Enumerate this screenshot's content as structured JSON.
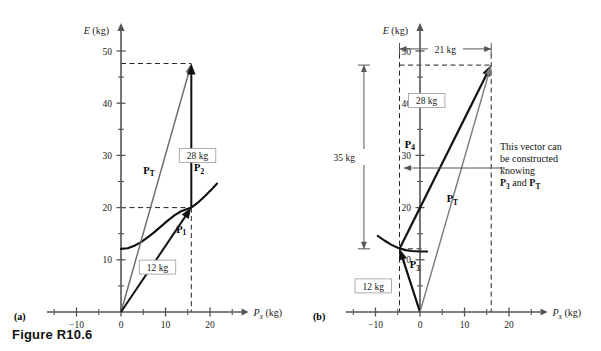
{
  "figure": {
    "caption": "Figure R10.6",
    "panel_a_letter": "(a)",
    "panel_b_letter": "(b)"
  },
  "axes": {
    "y_title_symbol": "E",
    "y_title_unit": " (kg)",
    "x_title_symbol": "P",
    "x_title_sub": "x",
    "x_title_unit": " (kg)",
    "x_ticks": [
      -10,
      0,
      10,
      20
    ],
    "x_tick_labels": [
      "−10",
      "0",
      "10",
      "20"
    ],
    "x_minor_ticks": [
      -15,
      -5,
      5,
      15,
      25
    ],
    "y_ticks": [
      10,
      20,
      30,
      40,
      50
    ],
    "y_tick_labels": [
      "10",
      "20",
      "30",
      "40",
      "50"
    ],
    "y_minor_ticks": [
      5,
      15,
      25,
      35,
      45
    ],
    "x_range": [
      -18,
      28
    ],
    "y_range": [
      0,
      55
    ]
  },
  "panel_a": {
    "vectors": [
      {
        "name": "P_T",
        "label_symbol": "P",
        "label_sub": "T",
        "label_x": 5.0,
        "label_y": 26.5,
        "from": [
          0,
          0
        ],
        "to": [
          15.8,
          47.6
        ],
        "color": "#6f6f6f",
        "width": 1.5,
        "head": "open"
      },
      {
        "name": "P_1",
        "label_symbol": "P",
        "label_sub": "1",
        "label_x": 12.4,
        "label_y": 15.2,
        "from": [
          0,
          0
        ],
        "to": [
          15.8,
          20.0
        ],
        "color": "#111111",
        "width": 2.0,
        "head": "solid"
      },
      {
        "name": "P_2",
        "label_symbol": "P",
        "label_sub": "2",
        "label_x": 16.4,
        "label_y": 27.0,
        "from": [
          15.8,
          20.0
        ],
        "to": [
          15.8,
          47.6
        ],
        "color": "#111111",
        "width": 2.0,
        "head": "solid"
      }
    ],
    "curve_points": [
      [
        0,
        12.1
      ],
      [
        1.5,
        12.2
      ],
      [
        3,
        12.7
      ],
      [
        4.5,
        13.4
      ],
      [
        6,
        14.3
      ],
      [
        7.5,
        15.3
      ],
      [
        9,
        16.4
      ],
      [
        10.5,
        17.5
      ],
      [
        12,
        18.5
      ],
      [
        13.5,
        19.3
      ],
      [
        15.8,
        20.0
      ],
      [
        17.5,
        21.1
      ],
      [
        19,
        22.3
      ],
      [
        20.5,
        23.6
      ],
      [
        21.6,
        24.6
      ]
    ],
    "box_labels": [
      {
        "name": "label-28kg",
        "text": "28 kg",
        "x": 17.2,
        "y": 30.0
      },
      {
        "name": "label-12kg",
        "text": "12 kg",
        "x": 8.2,
        "y": 8.6
      }
    ],
    "dashed_guides": [
      {
        "name": "guide-horizontal-47",
        "from": [
          0,
          47.6
        ],
        "to": [
          15.8,
          47.6
        ]
      },
      {
        "name": "guide-horizontal-20",
        "from": [
          0,
          20.0
        ],
        "to": [
          15.8,
          20.0
        ]
      },
      {
        "name": "guide-vertical-15.8",
        "from": [
          15.8,
          20.0
        ],
        "to": [
          15.8,
          0
        ]
      }
    ]
  },
  "panel_b": {
    "vectors": [
      {
        "name": "P_3",
        "label_symbol": "P",
        "label_sub": "3",
        "label_x": -2.3,
        "label_y": 8.4,
        "from": [
          0,
          0
        ],
        "to": [
          -4.6,
          12.1
        ],
        "color": "#111111",
        "width": 2.2,
        "head": "solid"
      },
      {
        "name": "P_4",
        "label_symbol": "P",
        "label_sub": "4",
        "label_x": -3.4,
        "label_y": 31.5,
        "from": [
          -4.6,
          12.1
        ],
        "to": [
          16.0,
          47.3
        ],
        "color": "#111111",
        "width": 2.2,
        "head": "solid"
      },
      {
        "name": "P_T",
        "label_symbol": "P",
        "label_sub": "T",
        "label_x": 6.0,
        "label_y": 21.0,
        "from": [
          0,
          0
        ],
        "to": [
          16.0,
          47.3
        ],
        "color": "#7b7b7b",
        "width": 1.4,
        "head": "open"
      }
    ],
    "curve_points": [
      [
        -9.5,
        14.6
      ],
      [
        -8,
        13.7
      ],
      [
        -6.5,
        12.9
      ],
      [
        -5,
        12.3
      ],
      [
        -3.5,
        11.9
      ],
      [
        -2,
        11.7
      ],
      [
        0,
        11.6
      ],
      [
        1.6,
        11.6
      ]
    ],
    "box_labels": [
      {
        "name": "label-28kg",
        "text": "28 kg",
        "x": 1.5,
        "y": 40.5
      },
      {
        "name": "label-12kg",
        "text": "12 kg",
        "x": -10.5,
        "y": 5.0
      }
    ],
    "dimensions": [
      {
        "name": "dimension-21kg",
        "orientation": "horizontal",
        "text": "21 kg",
        "from": [
          -4.6,
          50.4
        ],
        "to": [
          16.0,
          50.4
        ]
      },
      {
        "name": "dimension-35kg",
        "orientation": "vertical",
        "text": "35 kg",
        "from": [
          -12.6,
          47.3
        ],
        "to": [
          -12.6,
          12.1
        ]
      }
    ],
    "dashed_guides": [
      {
        "name": "guide-vertical-left",
        "from": [
          -4.6,
          49.5
        ],
        "to": [
          -4.6,
          0
        ]
      },
      {
        "name": "guide-vertical-right",
        "from": [
          16.0,
          49.5
        ],
        "to": [
          16.0,
          0
        ]
      },
      {
        "name": "guide-horizontal-top",
        "from": [
          -4.6,
          47.3
        ],
        "to": [
          16.0,
          47.3
        ]
      },
      {
        "name": "guide-horizontal-p3",
        "from": [
          -4.6,
          12.1
        ],
        "to": [
          1.2,
          12.1
        ]
      }
    ],
    "annotation": {
      "line1": "This vector can",
      "line2": "be constructed",
      "line3": "knowing",
      "line4_pre": "P",
      "line4_sub1": "3",
      "line4_mid": " and ",
      "line4_post": "P",
      "line4_sub2": "T",
      "x": 500,
      "y": 150,
      "leader_from": [
        505,
        168
      ],
      "leader_to": [
        404,
        168
      ]
    }
  },
  "chart_data": {
    "type": "scatter",
    "title": "Figure R10.6",
    "xlabel": "Px (kg)",
    "ylabel": "E (kg)",
    "xlim": [
      -18,
      28
    ],
    "ylim": [
      0,
      55
    ],
    "grid": false,
    "legend": "none",
    "panels": [
      {
        "id": "a",
        "label": "(a)",
        "annotations": [
          "28 kg",
          "12 kg"
        ],
        "series": [
          {
            "name": "P_T",
            "type": "vector",
            "x": [
              0,
              15.8
            ],
            "y": [
              0,
              47.6
            ]
          },
          {
            "name": "P_1",
            "type": "vector",
            "x": [
              0,
              15.8
            ],
            "y": [
              0,
              20.0
            ]
          },
          {
            "name": "P_2",
            "type": "vector",
            "x": [
              15.8,
              15.8
            ],
            "y": [
              20.0,
              47.6
            ]
          },
          {
            "name": "energy-curve",
            "type": "line",
            "x": [
              0,
              3,
              6,
              9,
              12,
              15.8,
              19,
              21.6
            ],
            "y": [
              12.1,
              12.7,
              14.3,
              16.4,
              18.5,
              20.0,
              22.3,
              24.6
            ]
          }
        ]
      },
      {
        "id": "b",
        "label": "(b)",
        "annotations": [
          "21 kg",
          "35 kg",
          "28 kg",
          "12 kg",
          "This vector can be constructed knowing P3 and PT"
        ],
        "series": [
          {
            "name": "P_3",
            "type": "vector",
            "x": [
              0,
              -4.6
            ],
            "y": [
              0,
              12.1
            ]
          },
          {
            "name": "P_4",
            "type": "vector",
            "x": [
              -4.6,
              16.0
            ],
            "y": [
              12.1,
              47.3
            ]
          },
          {
            "name": "P_T",
            "type": "vector",
            "x": [
              0,
              16.0
            ],
            "y": [
              0,
              47.3
            ]
          },
          {
            "name": "energy-curve",
            "type": "line",
            "x": [
              -9.5,
              -6.5,
              -3.5,
              0,
              1.6
            ],
            "y": [
              14.6,
              12.9,
              11.9,
              11.6,
              11.6
            ]
          }
        ]
      }
    ]
  }
}
